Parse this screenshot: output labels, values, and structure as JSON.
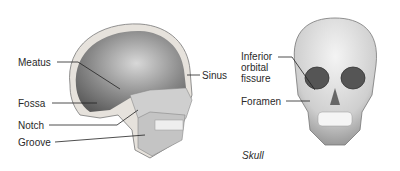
{
  "diagram": {
    "lateral_view": {
      "labels": [
        {
          "id": "meatus",
          "text": "Meatus"
        },
        {
          "id": "fossa",
          "text": "Fossa"
        },
        {
          "id": "notch",
          "text": "Notch"
        },
        {
          "id": "groove",
          "text": "Groove"
        },
        {
          "id": "sinus",
          "text": "Sinus"
        }
      ]
    },
    "frontal_view": {
      "labels": [
        {
          "id": "inferior-orbital-fissure",
          "lines": [
            "Inferior",
            "orbital",
            "fissure"
          ]
        },
        {
          "id": "foramen",
          "text": "Foramen"
        }
      ],
      "caption": "Skull"
    }
  }
}
